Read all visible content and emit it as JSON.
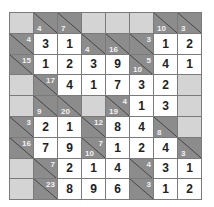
{
  "puzzle": {
    "type": "kakuro",
    "rows": 9,
    "cols": 8,
    "colors": {
      "clue_bg": "#8c8c8c",
      "blank_bg": "#d4d4d4",
      "entry_bg": "#ffffff",
      "clue_text": "#f2f2f2",
      "entry_text": "#222222",
      "grid_line": "#7a7a7a"
    },
    "grid": [
      [
        {
          "t": "B"
        },
        {
          "t": "C",
          "down": "4"
        },
        {
          "t": "C",
          "down": "7"
        },
        {
          "t": "B"
        },
        {
          "t": "B"
        },
        {
          "t": "B"
        },
        {
          "t": "C",
          "down": "10"
        },
        {
          "t": "C",
          "down": "3"
        }
      ],
      [
        {
          "t": "C",
          "right": "4"
        },
        {
          "t": "E",
          "v": "3"
        },
        {
          "t": "E",
          "v": "1"
        },
        {
          "t": "C",
          "down": "4"
        },
        {
          "t": "C",
          "down": "16"
        },
        {
          "t": "C",
          "right": "3"
        },
        {
          "t": "E",
          "v": "1"
        },
        {
          "t": "E",
          "v": "2"
        }
      ],
      [
        {
          "t": "C",
          "right": "15"
        },
        {
          "t": "E",
          "v": "1"
        },
        {
          "t": "E",
          "v": "2"
        },
        {
          "t": "E",
          "v": "3"
        },
        {
          "t": "E",
          "v": "9"
        },
        {
          "t": "C",
          "right": "5",
          "down": "10"
        },
        {
          "t": "E",
          "v": "4"
        },
        {
          "t": "E",
          "v": "1"
        }
      ],
      [
        {
          "t": "B"
        },
        {
          "t": "C",
          "right": "17"
        },
        {
          "t": "E",
          "v": "4"
        },
        {
          "t": "E",
          "v": "1"
        },
        {
          "t": "E",
          "v": "7"
        },
        {
          "t": "E",
          "v": "3"
        },
        {
          "t": "E",
          "v": "2"
        },
        {
          "t": "B"
        }
      ],
      [
        {
          "t": "B"
        },
        {
          "t": "C",
          "down": "9"
        },
        {
          "t": "C",
          "down": "20"
        },
        {
          "t": "B"
        },
        {
          "t": "C",
          "right": "4",
          "down": "19"
        },
        {
          "t": "E",
          "v": "1"
        },
        {
          "t": "E",
          "v": "3"
        },
        {
          "t": "B"
        }
      ],
      [
        {
          "t": "C",
          "right": "3"
        },
        {
          "t": "E",
          "v": "2"
        },
        {
          "t": "E",
          "v": "1"
        },
        {
          "t": "C",
          "right": "12"
        },
        {
          "t": "E",
          "v": "8"
        },
        {
          "t": "E",
          "v": "4"
        },
        {
          "t": "C",
          "down": "8"
        },
        {
          "t": "B"
        }
      ],
      [
        {
          "t": "C",
          "right": "16"
        },
        {
          "t": "E",
          "v": "7"
        },
        {
          "t": "E",
          "v": "9"
        },
        {
          "t": "C",
          "right": "7",
          "down": "10"
        },
        {
          "t": "E",
          "v": "1"
        },
        {
          "t": "E",
          "v": "2"
        },
        {
          "t": "E",
          "v": "4"
        },
        {
          "t": "C",
          "down": "3"
        }
      ],
      [
        {
          "t": "B"
        },
        {
          "t": "C",
          "right": "7"
        },
        {
          "t": "E",
          "v": "2"
        },
        {
          "t": "E",
          "v": "1"
        },
        {
          "t": "E",
          "v": "4"
        },
        {
          "t": "C",
          "right": "4"
        },
        {
          "t": "E",
          "v": "3"
        },
        {
          "t": "E",
          "v": "1"
        }
      ],
      [
        {
          "t": "B"
        },
        {
          "t": "C",
          "right": "23"
        },
        {
          "t": "E",
          "v": "8"
        },
        {
          "t": "E",
          "v": "9"
        },
        {
          "t": "E",
          "v": "6"
        },
        {
          "t": "C",
          "right": "3"
        },
        {
          "t": "E",
          "v": "1"
        },
        {
          "t": "E",
          "v": "2"
        }
      ]
    ]
  }
}
